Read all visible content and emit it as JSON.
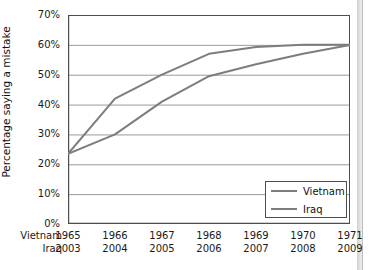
{
  "figure": {
    "background_color": "#ffffff",
    "line_color": "#7d7d7d",
    "axis_color": "#4d4d4d",
    "grid_color": "#9a9a9a"
  },
  "chart_data": {
    "type": "line",
    "title": "",
    "xlabel": "",
    "ylabel": "Percentage saying a mistake",
    "ylim": [
      0,
      70
    ],
    "yticks": [
      0,
      10,
      20,
      30,
      40,
      50,
      60,
      70
    ],
    "ytick_labels": [
      "0%",
      "10%",
      "20%",
      "30%",
      "40%",
      "50%",
      "60%",
      "70%"
    ],
    "grid": true,
    "legend_position": "lower right",
    "x_axis_rows": [
      {
        "name": "Vietnam",
        "tick_labels": [
          "1965",
          "1966",
          "1967",
          "1968",
          "1969",
          "1970",
          "1971"
        ]
      },
      {
        "name": "Iraq",
        "tick_labels": [
          "2003",
          "2004",
          "2005",
          "2006",
          "2007",
          "2008",
          "2009"
        ]
      }
    ],
    "categories": [
      "1",
      "2",
      "3",
      "4",
      "5",
      "6",
      "7"
    ],
    "series": [
      {
        "name": "Vietnam",
        "color": "#7d7d7d",
        "values": [
          23.5,
          42.0,
          50.0,
          57.0,
          59.3,
          60.0,
          60.0
        ]
      },
      {
        "name": "Iraq",
        "color": "#7d7d7d",
        "values": [
          23.5,
          30.0,
          41.0,
          49.5,
          53.5,
          57.0,
          60.0
        ]
      }
    ]
  },
  "legend": {
    "items": [
      {
        "label": "Vietnam"
      },
      {
        "label": "Iraq"
      }
    ]
  }
}
